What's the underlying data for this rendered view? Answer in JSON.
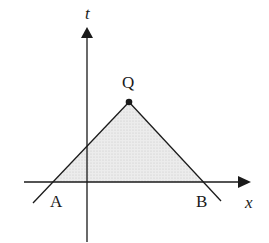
{
  "diagram": {
    "type": "spacetime-triangle",
    "axes": {
      "horizontal_label": "x",
      "vertical_label": "t"
    },
    "points": {
      "apex": {
        "label": "Q",
        "x": 129,
        "y": 102
      },
      "left_base": {
        "label": "A",
        "x": 54,
        "y": 182
      },
      "right_base": {
        "label": "B",
        "x": 202,
        "y": 182
      }
    },
    "colors": {
      "line": "#1a1a1a",
      "fill": "#e6e6e6",
      "background": "#ffffff"
    }
  }
}
